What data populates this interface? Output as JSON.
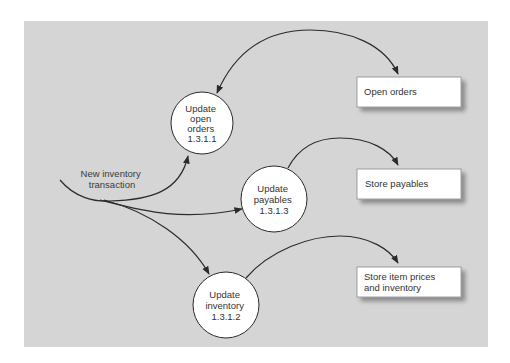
{
  "diagram": {
    "type": "data-flow-diagram",
    "colors": {
      "background": "#d5d5d5",
      "process_fill": "#ffffff",
      "store_fill": "#ffffff",
      "line": "#2b2b2b",
      "text": "#333333"
    },
    "input_flow": {
      "label_lines": [
        "New inventory",
        "transaction"
      ]
    },
    "processes": [
      {
        "id": "p1",
        "lines": [
          "Update",
          "open",
          "orders",
          "1.3.1.1"
        ],
        "name": "Update open orders",
        "number": "1.3.1.1"
      },
      {
        "id": "p2",
        "lines": [
          "Update",
          "payables",
          "1.3.1.3"
        ],
        "name": "Update payables",
        "number": "1.3.1.3"
      },
      {
        "id": "p3",
        "lines": [
          "Update",
          "inventory",
          "1.3.1.2"
        ],
        "name": "Update inventory",
        "number": "1.3.1.2"
      }
    ],
    "stores": [
      {
        "id": "s1",
        "lines": [
          "Open orders"
        ]
      },
      {
        "id": "s2",
        "lines": [
          "Store payables"
        ]
      },
      {
        "id": "s3",
        "lines": [
          "Store item prices",
          "and inventory"
        ]
      }
    ],
    "flows": [
      {
        "from": "input",
        "to": "p1",
        "direction": "forward"
      },
      {
        "from": "input",
        "to": "p2",
        "direction": "forward"
      },
      {
        "from": "input",
        "to": "p3",
        "direction": "forward"
      },
      {
        "from": "p1",
        "to": "s1",
        "direction": "bidirectional"
      },
      {
        "from": "p2",
        "to": "s2",
        "direction": "forward"
      },
      {
        "from": "p3",
        "to": "s3",
        "direction": "forward"
      }
    ]
  }
}
